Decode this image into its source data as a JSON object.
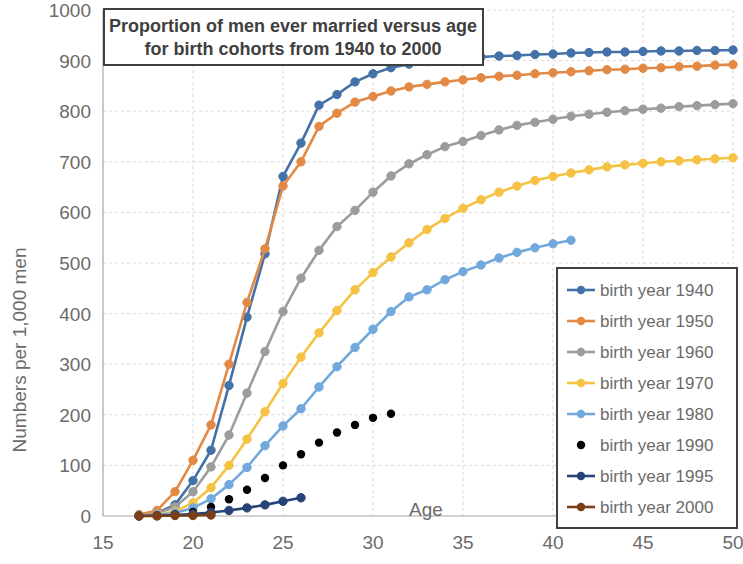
{
  "chart_data": {
    "type": "line",
    "title": "Proportion of men ever married versus age for birth cohorts from 1940 to 2000",
    "title_line1": "Proportion of men ever married versus age",
    "title_line2": "for birth cohorts from 1940 to 2000",
    "xlabel": "Age",
    "ylabel": "Numbers per 1,000 men",
    "xlim": [
      15,
      50
    ],
    "ylim": [
      0,
      1000
    ],
    "xticks": [
      15,
      20,
      25,
      30,
      35,
      40,
      45,
      50
    ],
    "yticks": [
      0,
      100,
      200,
      300,
      400,
      500,
      600,
      700,
      800,
      900,
      1000
    ],
    "grid": true,
    "legend_position": "right-bottom",
    "markers": true,
    "series": [
      {
        "name": "birth year 1940",
        "color": "#4472a8",
        "x": [
          17,
          18,
          19,
          20,
          21,
          22,
          23,
          24,
          25,
          26,
          27,
          28,
          29,
          30,
          31,
          32,
          33,
          34,
          35,
          36,
          37,
          38,
          39,
          40,
          41,
          42,
          43,
          44,
          45,
          46,
          47,
          48,
          49,
          50
        ],
        "values": [
          2,
          6,
          22,
          70,
          130,
          258,
          393,
          518,
          671,
          737,
          812,
          833,
          858,
          874,
          886,
          893,
          898,
          901,
          905,
          907,
          909,
          910,
          912,
          913,
          915,
          916,
          917,
          917,
          918,
          919,
          919,
          920,
          920,
          921
        ]
      },
      {
        "name": "birth year 1950",
        "color": "#e28a45",
        "x": [
          17,
          18,
          19,
          20,
          21,
          22,
          23,
          24,
          25,
          26,
          27,
          28,
          29,
          30,
          31,
          32,
          33,
          34,
          35,
          36,
          37,
          38,
          39,
          40,
          41,
          42,
          43,
          44,
          45,
          46,
          47,
          48,
          49,
          50
        ],
        "values": [
          3,
          11,
          48,
          110,
          180,
          300,
          422,
          528,
          652,
          700,
          770,
          796,
          818,
          829,
          840,
          848,
          853,
          858,
          862,
          866,
          869,
          871,
          874,
          876,
          878,
          880,
          882,
          883,
          885,
          886,
          888,
          889,
          891,
          892
        ]
      },
      {
        "name": "birth year 1960",
        "color": "#9c9c9c",
        "x": [
          17,
          18,
          19,
          20,
          21,
          22,
          23,
          24,
          25,
          26,
          27,
          28,
          29,
          30,
          31,
          32,
          33,
          34,
          35,
          36,
          37,
          38,
          39,
          40,
          41,
          42,
          43,
          44,
          45,
          46,
          47,
          48,
          49,
          50
        ],
        "values": [
          1,
          5,
          18,
          48,
          97,
          160,
          243,
          325,
          404,
          470,
          525,
          572,
          604,
          640,
          672,
          696,
          714,
          730,
          740,
          752,
          763,
          772,
          778,
          784,
          790,
          794,
          798,
          801,
          804,
          806,
          809,
          811,
          813,
          815
        ]
      },
      {
        "name": "birth year 1970",
        "color": "#f5c243",
        "x": [
          17,
          18,
          19,
          20,
          21,
          22,
          23,
          24,
          25,
          26,
          27,
          28,
          29,
          30,
          31,
          32,
          33,
          34,
          35,
          36,
          37,
          38,
          39,
          40,
          41,
          42,
          43,
          44,
          45,
          46,
          47,
          48,
          49,
          50
        ],
        "values": [
          1,
          3,
          9,
          26,
          56,
          100,
          152,
          206,
          262,
          314,
          362,
          406,
          447,
          481,
          512,
          540,
          566,
          588,
          608,
          625,
          640,
          652,
          663,
          671,
          678,
          684,
          690,
          694,
          697,
          700,
          702,
          704,
          706,
          708
        ]
      },
      {
        "name": "birth year 1980",
        "color": "#72a9dd",
        "x": [
          17,
          18,
          19,
          20,
          21,
          22,
          23,
          24,
          25,
          26,
          27,
          28,
          29,
          30,
          31,
          32,
          33,
          34,
          35,
          36,
          37,
          38,
          39,
          40,
          41
        ],
        "values": [
          1,
          2,
          6,
          16,
          34,
          62,
          96,
          139,
          178,
          212,
          255,
          295,
          333,
          369,
          404,
          433,
          447,
          467,
          483,
          496,
          510,
          521,
          530,
          538,
          545
        ]
      },
      {
        "name": "birth year 1990",
        "color": "#7fa champion",
        "x": [
          17,
          18,
          19,
          20,
          21,
          22,
          23,
          24,
          25,
          26,
          27,
          28,
          29,
          30,
          31
        ],
        "values": [
          0,
          1,
          3,
          8,
          18,
          33,
          52,
          75,
          100,
          122,
          145,
          165,
          180,
          194,
          202
        ]
      },
      {
        "name": "birth year 1995",
        "color": "#264478",
        "x": [
          17,
          18,
          19,
          20,
          21,
          22,
          23,
          24,
          25,
          26
        ],
        "values": [
          0,
          1,
          2,
          4,
          7,
          11,
          16,
          22,
          29,
          36
        ]
      },
      {
        "name": "birth year 2000",
        "color": "#7b3f17",
        "x": [
          17,
          18,
          19,
          20,
          21
        ],
        "values": [
          0,
          0,
          1,
          1,
          2
        ]
      }
    ]
  }
}
